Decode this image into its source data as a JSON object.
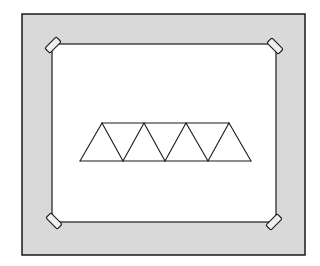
{
  "diagram": {
    "colors": {
      "background": "#ffffff",
      "frame_fill": "#d9d9d9",
      "inner_fill": "#ffffff",
      "stroke": "#1a1a1a",
      "tape_fill": "#f0f0f0"
    },
    "outer_frame": {
      "x": 22,
      "y": 14,
      "width": 283,
      "height": 241
    },
    "inner_sheet": {
      "x": 52,
      "y": 44,
      "width": 224,
      "height": 178
    },
    "tapes": [
      {
        "name": "top-left",
        "cx": 53,
        "cy": 45,
        "angle": -45
      },
      {
        "name": "top-right",
        "cx": 275,
        "cy": 46,
        "angle": 45
      },
      {
        "name": "bottom-left",
        "cx": 54,
        "cy": 221,
        "angle": 45
      },
      {
        "name": "bottom-right",
        "cx": 274,
        "cy": 222,
        "angle": -45
      }
    ],
    "truss": {
      "top_chord": {
        "y": 123,
        "x_start": 102,
        "x_end": 229
      },
      "bottom_chord": {
        "y": 161,
        "x_start": 80,
        "x_end": 251
      },
      "top_nodes_x": [
        102,
        144,
        186,
        229
      ],
      "bottom_nodes_x": [
        80,
        123,
        165,
        208,
        251
      ],
      "triangle_count": 7
    }
  }
}
